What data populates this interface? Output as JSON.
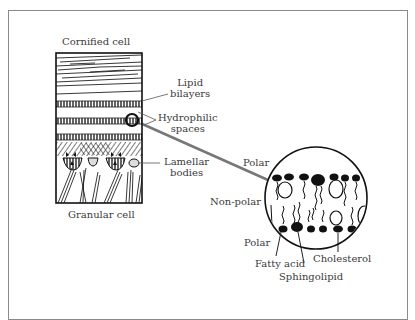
{
  "diagram": {
    "left_panel": {
      "top_label": "Cornified cell",
      "bottom_label": "Granular cell",
      "callouts": {
        "lipid_bilayers": [
          "Lipid",
          "bilayers"
        ],
        "hydrophilic_spaces": [
          "Hydrophilic",
          "spaces"
        ],
        "lamellar_bodies": [
          "Lamellar",
          "bodies"
        ]
      }
    },
    "magnified_view": {
      "regions": {
        "polar_top": "Polar",
        "non_polar": "Non-polar",
        "polar_bottom": "Polar"
      },
      "components": {
        "fatty_acid": "Fatty acid",
        "sphingolipid": "Sphingolipid",
        "cholesterol": "Cholesterol"
      }
    },
    "colors": {
      "ink": "#1a1a1a",
      "frame": "#8a8a8a",
      "connector": "#777777",
      "text": "#3a3a3a"
    }
  }
}
